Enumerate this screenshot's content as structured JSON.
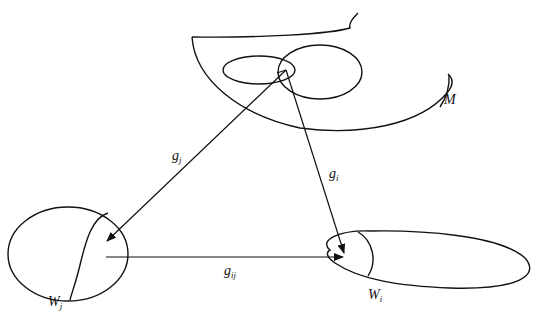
{
  "diagram": {
    "manifold_label": "M",
    "chart_domains": [
      {
        "id": "j",
        "base": "W",
        "sub": "j"
      },
      {
        "id": "i",
        "base": "W",
        "sub": "i"
      }
    ],
    "maps": [
      {
        "id": "gj",
        "base": "g",
        "sub": "j",
        "from": "M",
        "to": "W_j"
      },
      {
        "id": "gi",
        "base": "g",
        "sub": "i",
        "from": "M",
        "to": "W_i"
      },
      {
        "id": "gij",
        "base": "g",
        "sub": "ij",
        "from": "W_j",
        "to": "W_i"
      }
    ],
    "colors": {
      "line": "#111111",
      "background": "#ffffff"
    }
  }
}
